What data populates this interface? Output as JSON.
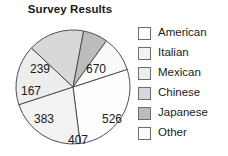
{
  "chart_data": {
    "type": "pie",
    "title": "Survey Results",
    "categories": [
      "American",
      "Italian",
      "Mexican",
      "Chinese",
      "Japanese",
      "Other"
    ],
    "values": [
      670,
      526,
      407,
      383,
      167,
      239
    ],
    "total": 2392,
    "legend_position": "right",
    "grid": false,
    "xlabel": "",
    "ylabel": "",
    "slice_colors": [
      "#fdfdfd",
      "#f2f2f2",
      "#ededed",
      "#d8d8d8",
      "#bcbcbc",
      "#fafafa"
    ],
    "slices": [
      {
        "label": "American",
        "value": "670",
        "color": "#fdfdfd",
        "start_deg": -18,
        "end_deg": 82.8,
        "label_x": 96,
        "label_y": 54
      },
      {
        "label": "Italian",
        "value": "526",
        "color": "#f2f2f2",
        "start_deg": 82.8,
        "end_deg": 161.9,
        "label_x": 112,
        "label_y": 104
      },
      {
        "label": "Mexican",
        "value": "407",
        "color": "#ededed",
        "start_deg": 161.9,
        "end_deg": 223.2,
        "label_x": 78,
        "label_y": 125
      },
      {
        "label": "Chinese",
        "value": "383",
        "color": "#d8d8d8",
        "start_deg": 223.2,
        "end_deg": 280.8,
        "label_x": 44,
        "label_y": 104
      },
      {
        "label": "Japanese",
        "value": "167",
        "color": "#bcbcbc",
        "start_deg": 280.8,
        "end_deg": 305.9,
        "label_x": 31,
        "label_y": 76
      },
      {
        "label": "Other",
        "value": "239",
        "color": "#fafafa",
        "start_deg": 305.9,
        "end_deg": 342,
        "label_x": 40,
        "label_y": 54
      }
    ]
  },
  "legend": {
    "items": [
      {
        "label": "American",
        "color": "#fdfdfd"
      },
      {
        "label": "Italian",
        "color": "#f2f2f2"
      },
      {
        "label": "Mexican",
        "color": "#ededed"
      },
      {
        "label": "Chinese",
        "color": "#d8d8d8"
      },
      {
        "label": "Japanese",
        "color": "#bcbcbc"
      },
      {
        "label": "Other",
        "color": "#fafafa"
      }
    ]
  },
  "style": {
    "stroke": "#4f4f4f",
    "text": "#1a1a1a"
  }
}
